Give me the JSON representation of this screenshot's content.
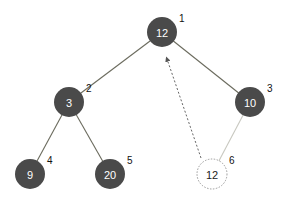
{
  "diagram": {
    "type": "binary-heap-insertion",
    "colors": {
      "node_fill": "#4a4a4a",
      "node_text": "#ffffff",
      "edge": "#6b6b5e",
      "new_edge": "#c8c8c0",
      "new_node_stroke": "#999999",
      "new_node_text": "#222222",
      "arrow": "#555555",
      "index_text": "#111111"
    },
    "nodes": [
      {
        "id": "n1",
        "value": "12",
        "index": "1",
        "cx": 162,
        "cy": 32,
        "style": "filled"
      },
      {
        "id": "n2",
        "value": "3",
        "index": "2",
        "cx": 69,
        "cy": 102,
        "style": "filled"
      },
      {
        "id": "n3",
        "value": "10",
        "index": "3",
        "cx": 250,
        "cy": 102,
        "style": "filled"
      },
      {
        "id": "n4",
        "value": "9",
        "index": "4",
        "cx": 30,
        "cy": 174,
        "style": "filled"
      },
      {
        "id": "n5",
        "value": "20",
        "index": "5",
        "cx": 110,
        "cy": 174,
        "style": "filled"
      },
      {
        "id": "n6",
        "value": "12",
        "index": "6",
        "cx": 212,
        "cy": 174,
        "style": "new"
      }
    ],
    "edges": [
      {
        "from": "n1",
        "to": "n2",
        "style": "solid"
      },
      {
        "from": "n1",
        "to": "n3",
        "style": "solid"
      },
      {
        "from": "n2",
        "to": "n4",
        "style": "solid"
      },
      {
        "from": "n2",
        "to": "n5",
        "style": "solid"
      },
      {
        "from": "n3",
        "to": "n6",
        "style": "light"
      }
    ],
    "arrows": [
      {
        "from": "n6",
        "to": "n1",
        "style": "dashed",
        "x1": 201,
        "y1": 158,
        "x2": 167,
        "y2": 59
      }
    ]
  }
}
